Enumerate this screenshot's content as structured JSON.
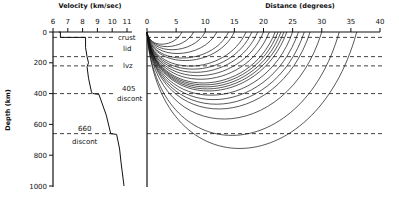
{
  "chart_data": [
    {
      "type": "line",
      "title": "Velocity (km/sec)",
      "xlabel": "Velocity (km/sec)",
      "ylabel": "Depth (km)",
      "xlim": [
        6,
        11
      ],
      "ylim": [
        0,
        1000
      ],
      "x_ticks": [
        "6",
        "7",
        "8",
        "9",
        "10",
        "11"
      ],
      "y_ticks": [
        "0",
        "200",
        "400",
        "600",
        "800",
        "1000"
      ],
      "series": [
        {
          "name": "velocity profile",
          "points": [
            [
              6.4,
              0
            ],
            [
              6.5,
              0
            ],
            [
              6.5,
              35
            ],
            [
              8.2,
              35
            ],
            [
              8.2,
              100
            ],
            [
              8.3,
              160
            ],
            [
              8.4,
              200
            ],
            [
              8.3,
              225
            ],
            [
              8.4,
              300
            ],
            [
              8.6,
              390
            ],
            [
              8.7,
              400
            ],
            [
              9.1,
              405
            ],
            [
              9.6,
              540
            ],
            [
              9.9,
              660
            ],
            [
              10.3,
              665
            ],
            [
              10.5,
              760
            ],
            [
              10.6,
              850
            ],
            [
              10.8,
              1000
            ]
          ]
        }
      ],
      "annotations": [
        {
          "text": "crust",
          "depth": 35
        },
        {
          "text": "lid",
          "depth": 100
        },
        {
          "text": "lvz",
          "depth": 215
        },
        {
          "text": "405",
          "depth": 375
        },
        {
          "text": "discont",
          "depth": 420
        },
        {
          "text": "660",
          "depth": 630
        },
        {
          "text": "discont",
          "depth": 700
        }
      ],
      "dashed_levels": [
        35,
        160,
        220,
        400,
        660
      ]
    },
    {
      "type": "line",
      "title": "Distance (degrees)",
      "xlabel": "Distance (degrees)",
      "xlim": [
        0,
        40
      ],
      "ylim": [
        0,
        1000
      ],
      "x_ticks": [
        "0",
        "5",
        "10",
        "15",
        "20",
        "25",
        "30",
        "35",
        "40"
      ],
      "grid": false,
      "series_description": "Seismic ray paths from surface source, turning depths increasing with distance",
      "ray_endpoints_deg": [
        6,
        8,
        10,
        12,
        14,
        15,
        17,
        18,
        19,
        20,
        21,
        22,
        22.5,
        23,
        23.5,
        24,
        25,
        26,
        27,
        28,
        30,
        33,
        36
      ],
      "dashed_levels": [
        35,
        160,
        220,
        400,
        660
      ]
    }
  ],
  "left_panel": {
    "title": "Velocity (km/sec)",
    "y_axis_label": "Depth (km)",
    "x_ticks": [
      "6",
      "7",
      "8",
      "9",
      "10",
      "11"
    ],
    "y_ticks": [
      "0",
      "200",
      "400",
      "600",
      "800",
      "1000"
    ],
    "labels": {
      "crust": "crust",
      "lid": "lid",
      "lvz": "lvz",
      "d405": "405",
      "d405b": "discont",
      "d660": "660",
      "d660b": "discont"
    }
  },
  "right_panel": {
    "title": "Distance (degrees)",
    "x_ticks": [
      "0",
      "5",
      "10",
      "15",
      "20",
      "25",
      "30",
      "35",
      "40"
    ]
  }
}
